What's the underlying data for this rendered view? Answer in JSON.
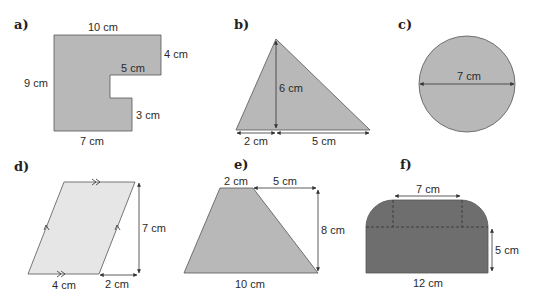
{
  "colors": {
    "fill_mid": "#b8b8b8",
    "fill_light": "#e6e6e6",
    "fill_dark": "#6e6e6e",
    "stroke": "#555555",
    "text": "#2a2a2a"
  },
  "shapes": [
    {
      "id": "a",
      "label": "a)",
      "type": "compound-rectilinear",
      "dimensions": {
        "top": "10 cm",
        "right_top": "4 cm",
        "notch_top": "5 cm",
        "left": "9 cm",
        "notch_right": "3 cm",
        "bottom": "7 cm"
      }
    },
    {
      "id": "b",
      "label": "b)",
      "type": "triangle",
      "dimensions": {
        "height": "6 cm",
        "base_left": "2 cm",
        "base_right": "5 cm"
      }
    },
    {
      "id": "c",
      "label": "c)",
      "type": "circle",
      "dimensions": {
        "diameter": "7 cm"
      }
    },
    {
      "id": "d",
      "label": "d)",
      "type": "parallelogram",
      "dimensions": {
        "height": "7 cm",
        "base": "4 cm",
        "offset": "2 cm"
      }
    },
    {
      "id": "e",
      "label": "e)",
      "type": "trapezium",
      "dimensions": {
        "top": "2 cm",
        "top_offset": "5 cm",
        "height": "8 cm",
        "bottom": "10 cm"
      }
    },
    {
      "id": "f",
      "label": "f)",
      "type": "rectangle-with-quarter-circles",
      "dimensions": {
        "top_width": "7 cm",
        "height": "5 cm",
        "bottom": "12 cm"
      }
    }
  ]
}
